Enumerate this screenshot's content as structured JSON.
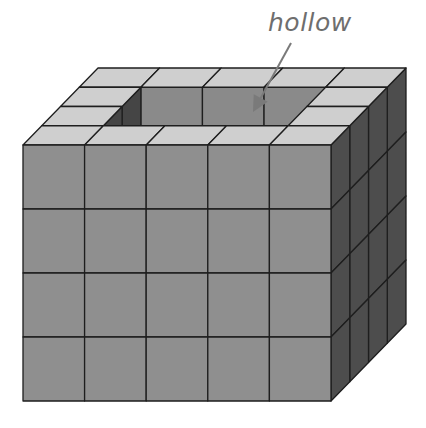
{
  "diagram": {
    "title": "",
    "annotation": {
      "text": "hollow",
      "color": "#6e6e6e"
    },
    "arrow": {
      "from": [
        291,
        43
      ],
      "to": [
        253,
        112
      ],
      "color": "#7a7a7a"
    },
    "cube_grid": {
      "columns": 5,
      "depth_rows": 4,
      "layers": 4,
      "top_layer_hollow": {
        "columns": [
          1,
          2,
          3
        ],
        "depth_rows": [
          1,
          2
        ]
      }
    },
    "geometry": {
      "origin": [
        23,
        145
      ],
      "cube_width": 61.6,
      "cube_height": 64,
      "depth_dx": 18.75,
      "depth_dy": -19.25
    },
    "colors": {
      "front": "#8f8f8f",
      "top": "#cfcfcf",
      "side": "#4d4d4d",
      "inner_back": "#8a8a8a",
      "inner_side": "#454545",
      "edge": "#1e1e1e",
      "background": "#ffffff"
    }
  }
}
